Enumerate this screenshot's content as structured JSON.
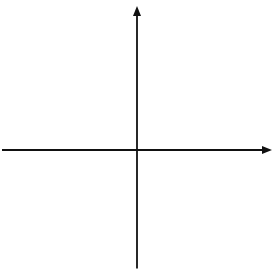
{
  "chart_data": {
    "type": "scatter",
    "title": "",
    "subtitle": "",
    "xlabel": "x",
    "ylabel": "y",
    "xlim": [
      -10,
      10
    ],
    "ylim": [
      -10,
      10
    ],
    "grid": true,
    "legend": null,
    "series": [],
    "x": [],
    "values": [],
    "annotations": [],
    "axes": {
      "x_axis_label": "x",
      "y_axis_label": "y",
      "x_tick_labels": [
        "-10",
        "-8",
        "-6",
        "-4",
        "-2",
        "2",
        "4",
        "6",
        "8",
        "10"
      ],
      "x_tick_values": [
        -10,
        -8,
        -6,
        -4,
        -2,
        2,
        4,
        6,
        8,
        10
      ],
      "y_tick_labels": [
        "10",
        "8",
        "6",
        "4",
        "2",
        "-2",
        "-4",
        "-6",
        "-8",
        "-10"
      ],
      "y_tick_values": [
        10,
        8,
        6,
        4,
        2,
        -2,
        -4,
        -6,
        -8,
        -10
      ],
      "origin_label_shown": false,
      "major_tick_step": 2,
      "minor_tick_step": 1,
      "arrowheads": [
        "x-positive",
        "y-positive"
      ]
    },
    "colors": {
      "axis": "#111111",
      "major_gridline": "#9a9a9a",
      "minor_gridline": "#d8d8d8",
      "background": "#ffffff",
      "text": "#1a1a1a"
    }
  },
  "grid_geometry": {
    "origin_x_px": 137.0,
    "origin_y_px": 150.0,
    "unit_px": 11.85,
    "left_px": 19.5,
    "right_px": 256.5,
    "top_px": 31.5,
    "bottom_px": 268.5
  }
}
